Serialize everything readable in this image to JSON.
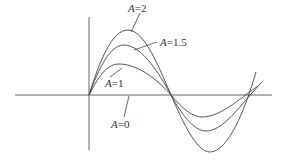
{
  "diagram": {
    "type": "family of sinusoidal-like curves",
    "curves": [
      {
        "label_var": "A",
        "label_eq": "=",
        "label_val": "2"
      },
      {
        "label_var": "A",
        "label_eq": "=",
        "label_val": "1.5"
      },
      {
        "label_var": "A",
        "label_eq": "=",
        "label_val": "1"
      },
      {
        "label_var": "A",
        "label_eq": "=",
        "label_val": "0"
      }
    ],
    "colors": {
      "line": "#444444",
      "axis": "#555555",
      "background": "#ffffff"
    }
  }
}
